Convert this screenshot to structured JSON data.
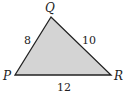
{
  "diagram": {
    "type": "triangle",
    "fill_color": "#d4d4d4",
    "stroke_color": "#222222",
    "vertices": [
      {
        "label": "Q",
        "x": 51,
        "y": 17
      },
      {
        "label": "P",
        "x": 15,
        "y": 75
      },
      {
        "label": "R",
        "x": 111,
        "y": 75
      }
    ],
    "sides": [
      {
        "between": "PQ",
        "length": "8"
      },
      {
        "between": "QR",
        "length": "10"
      },
      {
        "between": "PR",
        "length": "12"
      }
    ]
  }
}
